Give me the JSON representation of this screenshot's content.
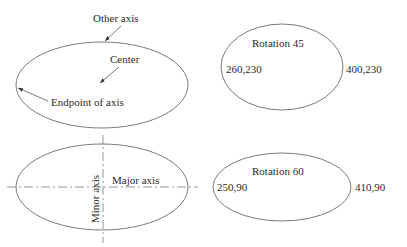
{
  "diagram": {
    "panel_anatomy": {
      "labels": {
        "other_axis": "Other axis",
        "center": "Center",
        "endpoint": "Endpoint of axis"
      }
    },
    "panel_rotation_45": {
      "title": "Rotation 45",
      "left_point": "260,230",
      "right_point": "400,230"
    },
    "panel_axes": {
      "major_label": "Major axis",
      "minor_label": "Minor axis"
    },
    "panel_rotation_60": {
      "title": "Rotation 60",
      "left_point": "250,90",
      "right_point": "410,90"
    }
  },
  "colors": {
    "outline": "#7a7a7a",
    "text": "#2a2a2a",
    "background": "#ffffff"
  }
}
